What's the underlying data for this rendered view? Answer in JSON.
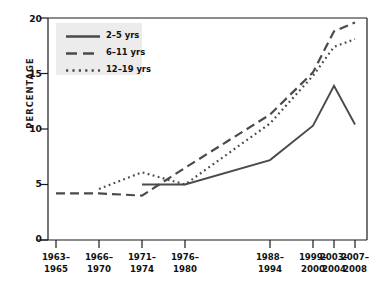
{
  "chart_data": {
    "type": "line",
    "title": "",
    "xlabel": "",
    "ylabel": "PERCENTAGE",
    "ylim": [
      0,
      20
    ],
    "yticks": [
      0,
      5,
      10,
      15,
      20
    ],
    "grid": false,
    "legend_position": "top-left",
    "categories": [
      "1963–1965",
      "1966–1970",
      "1971–1974",
      "1976–1980",
      "1988–1994",
      "1999–2000",
      "2003–2004",
      "2007–2008"
    ],
    "category_lines": [
      [
        "1963–",
        "1965"
      ],
      [
        "1966–",
        "1970"
      ],
      [
        "1971–",
        "1974"
      ],
      [
        "1976–",
        "1980"
      ],
      [
        "1988–",
        "1994"
      ],
      [
        "1999–",
        "2000"
      ],
      [
        "2003–",
        "2004"
      ],
      [
        "2007–",
        "2008"
      ]
    ],
    "series": [
      {
        "name": "2–5 yrs",
        "style": "solid",
        "color": "#4a4a4a",
        "values": [
          null,
          null,
          5.0,
          5.0,
          7.2,
          10.3,
          13.9,
          10.4
        ]
      },
      {
        "name": "6–11 yrs",
        "style": "dashed",
        "color": "#4a4a4a",
        "values": [
          4.2,
          4.2,
          4.0,
          6.5,
          11.3,
          15.1,
          18.8,
          19.6
        ]
      },
      {
        "name": "12–19 yrs",
        "style": "dotted",
        "color": "#4a4a4a",
        "values": [
          null,
          4.6,
          6.1,
          5.0,
          10.5,
          14.8,
          17.4,
          18.1
        ]
      }
    ]
  },
  "axis": {
    "y_tick_labels": [
      "20",
      "15",
      "10",
      "5",
      "0"
    ],
    "y_axis_title": "PERCENTAGE"
  },
  "legend": {
    "entries": [
      {
        "label": "2–5 yrs",
        "style": "solid"
      },
      {
        "label": "6–11 yrs",
        "style": "dashed"
      },
      {
        "label": "12–19 yrs",
        "style": "dotted"
      }
    ]
  },
  "colors": {
    "line": "#4a4a4a",
    "axis": "#1a1a1a",
    "legend_background": "#ececed",
    "background": "#ffffff"
  }
}
